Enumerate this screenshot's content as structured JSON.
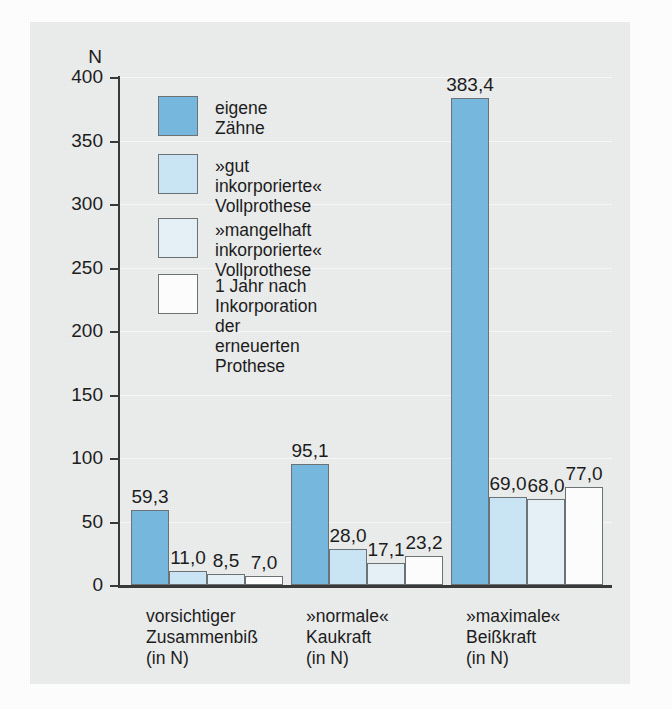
{
  "chart_data": {
    "type": "bar",
    "title": "",
    "xlabel": "",
    "ylabel": "N",
    "ylim": [
      0,
      400
    ],
    "yticks": [
      0,
      50,
      100,
      150,
      200,
      250,
      300,
      350,
      400
    ],
    "ytick_labels": [
      "0",
      "50",
      "100",
      "150",
      "200",
      "250",
      "300",
      "350",
      "400"
    ],
    "grid": true,
    "legend_position": "upper-left-inside",
    "categories": [
      "vorsichtiger\nZusammenbiß\n(in N)",
      "»normale«\nKaukraft\n(in N)",
      "»maximale«\nBeißkraft\n(in N)"
    ],
    "series": [
      {
        "name": "eigene Zähne",
        "color": "#78b9e0",
        "values": [
          59.3,
          95.1,
          383.4
        ],
        "labels": [
          "59,3",
          "95,1",
          "383,4"
        ]
      },
      {
        "name": "»gut inkorporierte«\nVollprothese",
        "color": "#cbe6f6",
        "values": [
          11.0,
          28.0,
          69.0
        ],
        "labels": [
          "11,0",
          "28,0",
          "69,0"
        ]
      },
      {
        "name": "»mangelhaft inkorporierte«\nVollprothese",
        "color": "#e6f2f8",
        "values": [
          8.5,
          17.1,
          68.0
        ],
        "labels": [
          "8,5",
          "17,1",
          "68,0"
        ]
      },
      {
        "name": "1 Jahr nach Inkorporation\nder erneuerten Prothese",
        "color": "#ffffff",
        "values": [
          7.0,
          23.2,
          77.0
        ],
        "labels": [
          "7,0",
          "23,2",
          "77,0"
        ]
      }
    ]
  },
  "legend": {
    "items": [
      {
        "label": "eigene Zähne",
        "color": "#78b9e0"
      },
      {
        "label": "»gut inkorporierte«\nVollprothese",
        "color": "#cbe6f6"
      },
      {
        "label": "»mangelhaft inkorporierte«\nVollprothese",
        "color": "#e6f2f8"
      },
      {
        "label": "1 Jahr nach Inkorporation\nder erneuerten Prothese",
        "color": "#ffffff"
      }
    ]
  },
  "colors": {
    "plate_background": "#eceded",
    "page_background": "#ffffff",
    "axis": "#3a3a3a",
    "bar_outline": "#6d7477",
    "text": "#1d1d1d"
  }
}
